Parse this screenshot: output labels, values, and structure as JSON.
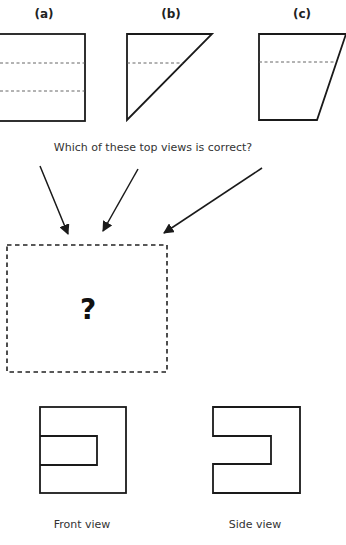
{
  "options": [
    {
      "id": "a",
      "label": "(a)",
      "shape": "rectangle",
      "hidden_lines": 2
    },
    {
      "id": "b",
      "label": "(b)",
      "shape": "right-triangle",
      "hidden_lines": 1
    },
    {
      "id": "c",
      "label": "(c)",
      "shape": "trapezoid",
      "hidden_lines": 1
    }
  ],
  "question": "Which of these top views is correct?",
  "answer_placeholder": "?",
  "views": {
    "front_label": "Front view",
    "side_label": "Side view"
  },
  "colors": {
    "line": "#1a1a1a",
    "hidden_line": "#555555",
    "background": "#ffffff"
  }
}
